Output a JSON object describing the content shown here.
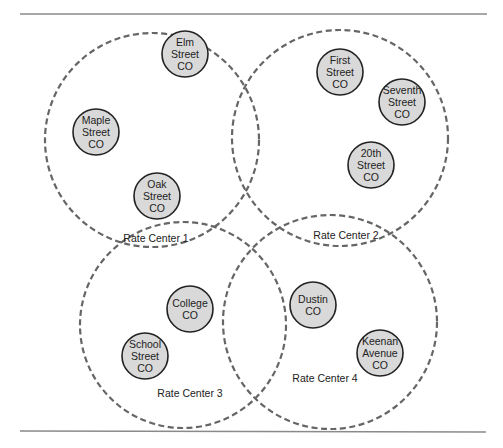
{
  "diagram": {
    "rate_centers": [
      {
        "label": "Rate Center 1",
        "cx": 152,
        "cy": 140,
        "r": 107,
        "label_x": 156,
        "label_y": 242
      },
      {
        "label": "Rate Center 2",
        "cx": 340,
        "cy": 138,
        "r": 108,
        "label_x": 346,
        "label_y": 239
      },
      {
        "label": "Rate Center 3",
        "cx": 183,
        "cy": 325,
        "r": 103,
        "label_x": 190,
        "label_y": 397
      },
      {
        "label": "Rate Center 4",
        "cx": 330,
        "cy": 322,
        "r": 107,
        "label_x": 325,
        "label_y": 382
      }
    ],
    "central_offices": [
      {
        "lines": [
          "Elm",
          "Street",
          "CO"
        ],
        "cx": 185,
        "cy": 54,
        "rate_center": "Rate Center 1"
      },
      {
        "lines": [
          "Maple",
          "Street",
          "CO"
        ],
        "cx": 96,
        "cy": 132,
        "rate_center": "Rate Center 1"
      },
      {
        "lines": [
          "Oak",
          "Street",
          "CO"
        ],
        "cx": 157,
        "cy": 196,
        "rate_center": "Rate Center 1"
      },
      {
        "lines": [
          "First",
          "Street",
          "CO"
        ],
        "cx": 340,
        "cy": 72,
        "rate_center": "Rate Center 2"
      },
      {
        "lines": [
          "Seventh",
          "Street",
          "CO"
        ],
        "cx": 402,
        "cy": 102,
        "rate_center": "Rate Center 2"
      },
      {
        "lines": [
          "20th",
          "Street",
          "CO"
        ],
        "cx": 371,
        "cy": 165,
        "rate_center": "Rate Center 2"
      },
      {
        "lines": [
          "College",
          "CO"
        ],
        "cx": 190,
        "cy": 309,
        "rate_center": "Rate Center 3"
      },
      {
        "lines": [
          "School",
          "Street",
          "CO"
        ],
        "cx": 145,
        "cy": 356,
        "rate_center": "Rate Center 3"
      },
      {
        "lines": [
          "Dustin",
          "CO"
        ],
        "cx": 313,
        "cy": 305,
        "rate_center": "Rate Center 4"
      },
      {
        "lines": [
          "Keenan",
          "Avenue",
          "CO"
        ],
        "cx": 380,
        "cy": 353,
        "rate_center": "Rate Center 4"
      }
    ],
    "colors": {
      "co_fill": "#d9d9d9",
      "co_stroke": "#222222",
      "rate_center_stroke": "#666666",
      "rule": "#8a8a8a"
    }
  }
}
